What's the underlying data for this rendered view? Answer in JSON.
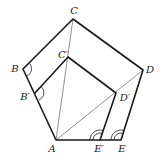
{
  "diagram": {
    "title": "",
    "points": {
      "A": {
        "label": "A",
        "x": 56,
        "y": 140,
        "label_x": 52,
        "label_y": 148
      },
      "B": {
        "label": "B",
        "x": 23,
        "y": 69,
        "label_x": 15,
        "label_y": 69
      },
      "C": {
        "label": "C",
        "x": 73,
        "y": 19,
        "label_x": 74,
        "label_y": 11
      },
      "D": {
        "label": "D",
        "x": 143,
        "y": 70,
        "label_x": 150,
        "label_y": 70
      },
      "E": {
        "label": "E",
        "x": 121,
        "y": 140,
        "label_x": 122,
        "label_y": 148
      },
      "B_prime": {
        "label": "B′",
        "x": 35,
        "y": 93,
        "label_x": 25,
        "label_y": 97
      },
      "C_prime": {
        "label": "C′",
        "x": 68,
        "y": 57,
        "label_x": 62,
        "label_y": 55
      },
      "D_prime": {
        "label": "D′",
        "x": 116,
        "y": 93,
        "label_x": 124,
        "label_y": 98
      },
      "E_prime": {
        "label": "E′",
        "x": 100,
        "y": 140,
        "label_x": 98,
        "label_y": 148
      }
    },
    "outer_pentagon": [
      "A",
      "B",
      "C",
      "D",
      "E"
    ],
    "inner_pentagon": [
      "A",
      "B′",
      "C′",
      "D′",
      "E′"
    ],
    "diagonals": [
      [
        "A",
        "C"
      ],
      [
        "A",
        "D"
      ]
    ],
    "angle_marks": [
      {
        "vertex": "B",
        "type": "single-arc"
      },
      {
        "vertex": "B′",
        "type": "single-arc"
      },
      {
        "vertex": "E′",
        "type": "double-arc"
      },
      {
        "vertex": "E",
        "type": "double-arc"
      }
    ]
  }
}
